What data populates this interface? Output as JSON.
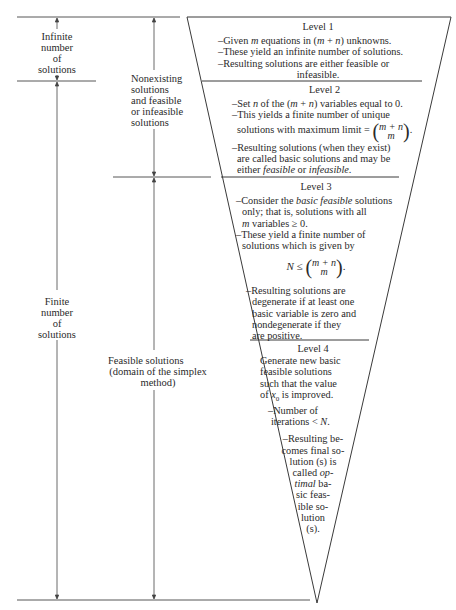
{
  "left_labels": {
    "infinite": [
      "Infinite",
      "number",
      "of",
      "solutions"
    ],
    "finite": [
      "Finite",
      "number",
      "of",
      "solutions"
    ],
    "nonexisting": [
      "Nonexisting",
      "solutions",
      "and feasible",
      "or infeasible",
      "solutions"
    ],
    "feasible": [
      "Feasible solutions",
      "(domain of the simplex",
      "method)"
    ]
  },
  "levels": [
    {
      "title": "Level 1",
      "items": [
        "–Given m equations in (m + n) unknowns.",
        "–These yield an infinite number of solutions.",
        "–Resulting solutions are either feasible or",
        "infeasible."
      ]
    },
    {
      "title": "Level 2",
      "items": [
        "–Set n of the (m + n) variables equal to 0.",
        "–This yields a finite number of unique solutions with maximum limit = (m+n choose m).",
        "–Resulting solutions (when they exist) are called basic solutions and may be either feasible or infeasible."
      ]
    },
    {
      "title": "Level 3",
      "items": [
        "–Consider the basic feasible solutions only; that is, solutions with all m variables ≥ 0.",
        "–These yield a finite number of solutions which is given by",
        "N ≤ (m+n choose m).",
        "–Resulting solutions are degenerate if at least one basic variable is zero and nondegenerate if they are positive."
      ]
    },
    {
      "title": "Level 4",
      "items": [
        "Generate new basic feasible solutions such that the value of x0 is improved.",
        "–Number of iterations < N.",
        "–Resulting becomes final solution (s) is called optimal basic feasible solution (s)."
      ]
    }
  ],
  "text": {
    "l1_a1": "–Given ",
    "l1_a2": "m",
    "l1_a3": " equations in (",
    "l1_a4": "m",
    "l1_a5": " + ",
    "l1_a6": "n",
    "l1_a7": ") unknowns.",
    "l1_b": "–These yield an infinite number of solutions.",
    "l1_c": "–Resulting solutions are either feasible or",
    "l1_d": "infeasible.",
    "l2_a1": "–Set ",
    "l2_a2": "n",
    "l2_a3": " of the (",
    "l2_a4": "m",
    "l2_a5": " + ",
    "l2_a6": "n",
    "l2_a7": ") variables equal to 0.",
    "l2_b1": "–This yields a finite number of unique",
    "l2_b2": "solutions with maximum limit = ",
    "binom_top": "m + n",
    "binom_bot": "m",
    "l2_c1": "–Resulting solutions (when they exist)",
    "l2_c2": "are called basic solutions and may be",
    "l2_c3": "either ",
    "l2_c4": "feasible",
    "l2_c5": " or ",
    "l2_c6": "infeasible",
    "l2_c7": ".",
    "l3_a1": "–Consider the ",
    "l3_a2": "basic feasible",
    "l3_a3": " solutions",
    "l3_a4": "only; that is, solutions with all",
    "l3_a5": "m",
    "l3_a6": " variables ≥ 0.",
    "l3_b1": "–These yield a finite number of",
    "l3_b2": "solutions which is given by",
    "l3_f1": "N",
    "l3_f2": " ≤ ",
    "l3_c1": "–Resulting solutions are",
    "l3_c2": "degenerate if at least one",
    "l3_c3": "basic variable is zero and",
    "l3_c4": "nondegenerate if they",
    "l3_c5": "are positive.",
    "l4_a1": "Generate new basic",
    "l4_a2": "feasible solutions",
    "l4_a3": "such that the value",
    "l4_a4": "of ",
    "l4_a5": "x",
    "l4_a6": "0",
    "l4_a7": " is improved.",
    "l4_b1": "–Number of",
    "l4_b2": "iterations < ",
    "l4_b3": "N",
    "l4_b4": ".",
    "l4_c1": "–Resulting be-",
    "l4_c2": "comes final so-",
    "l4_c3": "lution (s) is",
    "l4_c4": "called ",
    "l4_c5": "op-",
    "l4_c6": "timal",
    "l4_c7": " ba-",
    "l4_c8": "sic feas-",
    "l4_c9": "ible so-",
    "l4_c10": "lution",
    "l4_c11": "(s)."
  },
  "colors": {
    "line": "#3a3a3a",
    "text": "#2a2a2a",
    "background": "#ffffff"
  }
}
